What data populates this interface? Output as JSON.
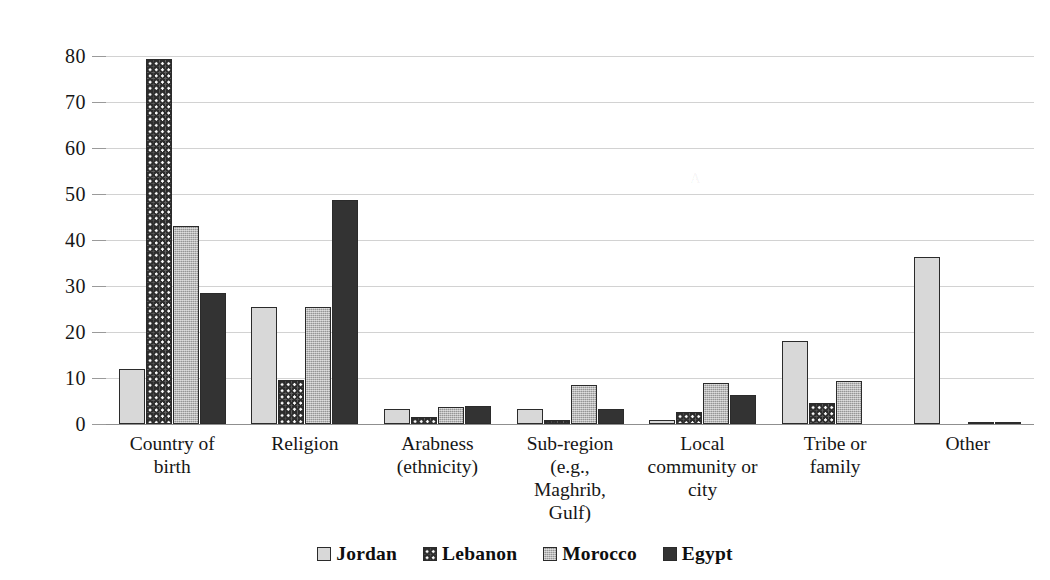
{
  "chart_data": {
    "type": "bar",
    "title": "",
    "subtitle": "",
    "xlabel": "",
    "ylabel": "",
    "ylim": [
      0,
      80
    ],
    "ytick_step": 10,
    "yticks": [
      80,
      70,
      60,
      50,
      40,
      30,
      20,
      10,
      0
    ],
    "grid": "horizontal",
    "legend_position": "bottom",
    "orientation": "vertical",
    "grouped": true,
    "categories": [
      "Country of birth",
      "Religion",
      "Arabness (ethnicity)",
      "Sub-region (e.g., Maghrib, Gulf)",
      "Local community or city",
      "Tribe or family",
      "Other"
    ],
    "category_lines": [
      [
        "Country of",
        "birth"
      ],
      [
        "Religion"
      ],
      [
        "Arabness",
        "(ethnicity)"
      ],
      [
        "Sub-region",
        "(e.g.,",
        "Maghrib,",
        "Gulf)"
      ],
      [
        "Local",
        "community or",
        "city"
      ],
      [
        "Tribe or",
        "family"
      ],
      [
        "Other"
      ]
    ],
    "series": [
      {
        "name": "Jordan",
        "pattern": "solid-light-gray",
        "color": "#c9c9c9",
        "values": [
          11.9,
          25.5,
          3.3,
          3.2,
          0.8,
          18.0,
          36.2
        ]
      },
      {
        "name": "Lebanon",
        "pattern": "checkerboard",
        "color": "#fbfbfb",
        "values": [
          79.3,
          9.5,
          1.5,
          0.9,
          2.6,
          4.5,
          0.0
        ]
      },
      {
        "name": "Morocco",
        "pattern": "textured-gray",
        "color": "#a8a8a8",
        "values": [
          43.0,
          25.5,
          3.6,
          8.5,
          8.9,
          9.4,
          0.4
        ]
      },
      {
        "name": "Egypt",
        "pattern": "solid-dark",
        "color": "#333333",
        "values": [
          28.5,
          48.6,
          4.0,
          3.2,
          6.2,
          0.0,
          0.5
        ]
      }
    ]
  },
  "legend": {
    "items": [
      {
        "label": "Jordan",
        "swatch": "legend-swatch-jordan"
      },
      {
        "label": "Lebanon",
        "swatch": "legend-swatch-lebanon"
      },
      {
        "label": "Morocco",
        "swatch": "legend-swatch-morocco"
      },
      {
        "label": "Egypt",
        "swatch": "legend-swatch-egypt"
      }
    ]
  }
}
